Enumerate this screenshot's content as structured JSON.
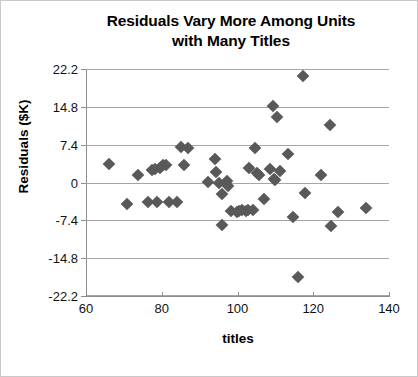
{
  "chart_data": {
    "type": "scatter",
    "title": "Residuals Vary More Among Units with Many Titles",
    "title_line1": "Residuals Vary More Among Units",
    "title_line2": "with Many Titles",
    "xlabel": "titles",
    "ylabel": "Residuals ($K)",
    "xlim": [
      60,
      140
    ],
    "ylim": [
      -22.2,
      22.2
    ],
    "xticks": [
      60,
      80,
      100,
      120,
      140
    ],
    "yticks": [
      22.2,
      14.8,
      7.4,
      0,
      -7.4,
      -14.8,
      -22.2
    ],
    "xtick_labels": [
      "60",
      "80",
      "100",
      "120",
      "140"
    ],
    "ytick_labels": [
      "22.2",
      "14.8",
      "7.4",
      "0",
      "-7.4",
      "-14.8",
      "-22.2"
    ],
    "grid": "horizontal",
    "legend": null,
    "marker_shape": "diamond",
    "marker_color": "#595959",
    "gridline_color": "#a6a6a6",
    "axis_color": "#8c8c8c",
    "series": [
      {
        "name": "residuals",
        "points": [
          [
            66.2,
            3.6
          ],
          [
            70.8,
            -4.3
          ],
          [
            73.8,
            1.4
          ],
          [
            76.3,
            -3.9
          ],
          [
            77.5,
            2.4
          ],
          [
            78.3,
            2.6
          ],
          [
            78.8,
            -3.9
          ],
          [
            79.6,
            2.9
          ],
          [
            80.3,
            3.4
          ],
          [
            81.0,
            3.5
          ],
          [
            81.8,
            -3.8
          ],
          [
            84.0,
            -3.9
          ],
          [
            85.0,
            6.9
          ],
          [
            86.0,
            3.5
          ],
          [
            87.0,
            6.7
          ],
          [
            92.3,
            0.1
          ],
          [
            94.0,
            4.6
          ],
          [
            94.4,
            2.1
          ],
          [
            95.2,
            -0.1
          ],
          [
            95.8,
            -2.2
          ],
          [
            96.0,
            -8.4
          ],
          [
            97.3,
            0.2
          ],
          [
            97.6,
            -0.6
          ],
          [
            98.4,
            -5.5
          ],
          [
            99.8,
            -5.8
          ],
          [
            100.5,
            -5.6
          ],
          [
            101.3,
            -5.4
          ],
          [
            102.2,
            -5.5
          ],
          [
            102.9,
            -5.4
          ],
          [
            103.0,
            2.9
          ],
          [
            104.0,
            -5.3
          ],
          [
            104.6,
            6.8
          ],
          [
            105.2,
            1.9
          ],
          [
            105.6,
            1.5
          ],
          [
            107.0,
            -3.2
          ],
          [
            108.6,
            2.6
          ],
          [
            109.3,
            15.0
          ],
          [
            109.6,
            0.7
          ],
          [
            110.0,
            0.5
          ],
          [
            110.3,
            12.8
          ],
          [
            111.2,
            2.2
          ],
          [
            113.3,
            5.5
          ],
          [
            114.6,
            -6.8
          ],
          [
            116.0,
            -18.5
          ],
          [
            117.3,
            20.9
          ],
          [
            117.8,
            -2.0
          ],
          [
            122.0,
            1.4
          ],
          [
            124.4,
            11.3
          ],
          [
            124.8,
            -8.5
          ],
          [
            126.6,
            -5.8
          ],
          [
            133.8,
            -4.9
          ]
        ]
      }
    ]
  }
}
